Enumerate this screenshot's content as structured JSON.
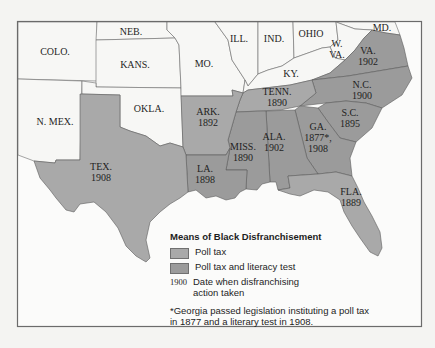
{
  "map": {
    "title": "Means of Black Disfranchisement",
    "colors": {
      "background": "#f4f4f2",
      "frame": "#6b6b6b",
      "non_southern_state": "#f7f7f5",
      "poll_tax": "#a9a9a9",
      "poll_tax_and_literacy_test": "#9b9b9b",
      "water": "#fbfbfa",
      "border": "#5c5c5c"
    },
    "states": [
      {
        "name": "NEB.",
        "year": null,
        "category": "none"
      },
      {
        "name": "COLO.",
        "year": null,
        "category": "none"
      },
      {
        "name": "KANS.",
        "year": null,
        "category": "none"
      },
      {
        "name": "MO.",
        "year": null,
        "category": "none"
      },
      {
        "name": "ILL.",
        "year": null,
        "category": "none"
      },
      {
        "name": "IND.",
        "year": null,
        "category": "none"
      },
      {
        "name": "OHIO",
        "year": null,
        "category": "none"
      },
      {
        "name": "MD.",
        "year": null,
        "category": "none"
      },
      {
        "name": "W. VA.",
        "line1": "W.",
        "line2": "VA.",
        "year": null,
        "category": "none"
      },
      {
        "name": "KY.",
        "year": null,
        "category": "none"
      },
      {
        "name": "OKLA.",
        "year": null,
        "category": "none"
      },
      {
        "name": "N. MEX.",
        "year": null,
        "category": "none"
      },
      {
        "name": "VA.",
        "year": "1902",
        "category": "poll_tax_and_literacy_test"
      },
      {
        "name": "N.C.",
        "year": "1900",
        "category": "poll_tax_and_literacy_test"
      },
      {
        "name": "TENN.",
        "year": "1890",
        "category": "poll_tax"
      },
      {
        "name": "S.C.",
        "year": "1895",
        "category": "poll_tax_and_literacy_test"
      },
      {
        "name": "ARK.",
        "year": "1892",
        "category": "poll_tax"
      },
      {
        "name": "GA.",
        "year": "1877*,",
        "year2": "1908",
        "category": "poll_tax_and_literacy_test"
      },
      {
        "name": "ALA.",
        "year": "1902",
        "category": "poll_tax_and_literacy_test"
      },
      {
        "name": "MISS.",
        "year": "1890",
        "category": "poll_tax_and_literacy_test"
      },
      {
        "name": "TEX.",
        "year": "1908",
        "category": "poll_tax"
      },
      {
        "name": "LA.",
        "year": "1898",
        "category": "poll_tax_and_literacy_test"
      },
      {
        "name": "FLA.",
        "year": "1889",
        "category": "poll_tax"
      }
    ]
  },
  "legend": {
    "title": "Means of Black Disfranchisement",
    "items": [
      {
        "label": "Poll tax",
        "color": "#a9a9a9"
      },
      {
        "label": "Poll tax and literacy test",
        "color": "#9b9b9b"
      }
    ],
    "date_sample": "1900",
    "date_label": "Date when disfranchising action taken",
    "footnote": "*Georgia passed legislation instituting a poll tax in 1877 and a literary test in 1908."
  }
}
